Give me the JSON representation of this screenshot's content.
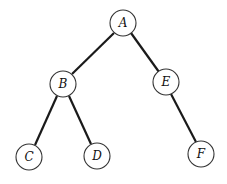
{
  "diagram": {
    "type": "binary-tree",
    "nodes": [
      {
        "id": "A",
        "label": "A",
        "x": 123,
        "y": 23
      },
      {
        "id": "B",
        "label": "B",
        "x": 63,
        "y": 84
      },
      {
        "id": "E",
        "label": "E",
        "x": 166,
        "y": 82
      },
      {
        "id": "C",
        "label": "C",
        "x": 29,
        "y": 157
      },
      {
        "id": "D",
        "label": "D",
        "x": 97,
        "y": 156
      },
      {
        "id": "F",
        "label": "F",
        "x": 201,
        "y": 154
      }
    ],
    "edges": [
      {
        "from": "A",
        "to": "B"
      },
      {
        "from": "A",
        "to": "E"
      },
      {
        "from": "B",
        "to": "C"
      },
      {
        "from": "B",
        "to": "D"
      },
      {
        "from": "E",
        "to": "F"
      }
    ],
    "node_radius": 13
  }
}
